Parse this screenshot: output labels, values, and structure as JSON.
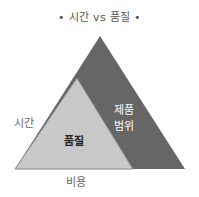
{
  "title": "• 시간 vs 품질 •",
  "labels": {
    "time": "시간",
    "cost": "비용",
    "quality": "품질",
    "scope_line1": "제품",
    "scope_line2": "범위"
  },
  "colors": {
    "outer_triangle": "#666666",
    "inner_triangle": "#c8c8c8",
    "inner_stroke": "#888888"
  }
}
